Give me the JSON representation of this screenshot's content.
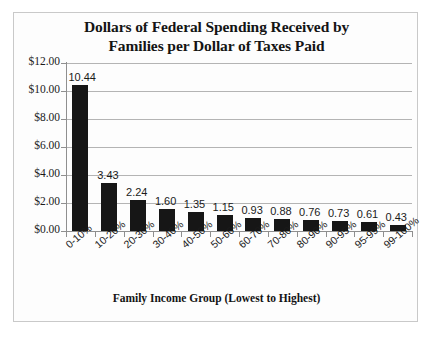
{
  "chart_data": {
    "type": "bar",
    "title": "Dollars of Federal Spending Received by Families per Dollar of Taxes Paid",
    "title_line1": "Dollars of Federal Spending Received by",
    "title_line2": "Families per Dollar of Taxes Paid",
    "xlabel": "Family Income Group (Lowest to Highest)",
    "ylabel": "",
    "categories": [
      "0-10%",
      "10-20%",
      "20-30%",
      "30-40%",
      "40-50%",
      "50-60%",
      "60-70%",
      "70-80%",
      "80-90%",
      "90-95%",
      "95-99%",
      "99-100%"
    ],
    "values": [
      10.44,
      3.43,
      2.24,
      1.6,
      1.35,
      1.15,
      0.93,
      0.88,
      0.76,
      0.73,
      0.61,
      0.43
    ],
    "value_labels": [
      "10.44",
      "3.43",
      "2.24",
      "1.60",
      "1.35",
      "1.15",
      "0.93",
      "0.88",
      "0.76",
      "0.73",
      "0.61",
      "0.43"
    ],
    "ylim": [
      0,
      12
    ],
    "y_ticks": [
      0,
      2,
      4,
      6,
      8,
      10,
      12
    ],
    "y_tick_labels": [
      "$0.00",
      "$2.00",
      "$4.00",
      "$6.00",
      "$8.00",
      "$10.00",
      "$12.00"
    ],
    "grid": true,
    "grid_axis": "y",
    "legend": false,
    "bar_color": "#161616",
    "grid_color": "#b4b4b4",
    "axis_color": "#8f8f8f",
    "background_color": "#fdfdfd",
    "frame_color": "#c9c9c9",
    "text_color": "#141414"
  }
}
